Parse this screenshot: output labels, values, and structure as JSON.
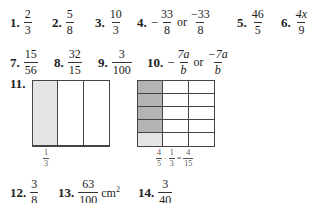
{
  "answers": {
    "a1": {
      "label": "1.",
      "num": "2",
      "den": "3"
    },
    "a2": {
      "label": "2.",
      "num": "5",
      "den": "8"
    },
    "a3": {
      "label": "3.",
      "num": "10",
      "den": "3"
    },
    "a4": {
      "label": "4.",
      "sign": "−",
      "num": "33",
      "den": "8",
      "or": "or",
      "num2": "−33",
      "den2": "8"
    },
    "a5": {
      "label": "5.",
      "num": "46",
      "den": "5"
    },
    "a6": {
      "label": "6.",
      "num": "4x",
      "den": "9"
    },
    "a7": {
      "label": "7.",
      "num": "15",
      "den": "56"
    },
    "a8": {
      "label": "8.",
      "num": "32",
      "den": "15"
    },
    "a9": {
      "label": "9.",
      "num": "3",
      "den": "100"
    },
    "a10": {
      "label": "10.",
      "sign": "−",
      "num": "7a",
      "den": "b",
      "or": "or",
      "num2": "−7a",
      "den2": "b"
    },
    "a11": {
      "label": "11."
    },
    "a12": {
      "label": "12.",
      "num": "3",
      "den": "8"
    },
    "a13": {
      "label": "13.",
      "num": "63",
      "den": "100",
      "unit": "cm",
      "exp": "2"
    },
    "a14": {
      "label": "14.",
      "num": "3",
      "den": "40"
    }
  },
  "diagram": {
    "left": {
      "cols": 3,
      "rows": 1,
      "shaded_color": "#e4e4e4",
      "label": {
        "num": "1",
        "den": "3"
      }
    },
    "right": {
      "cols": 3,
      "rows": 5,
      "dark_color": "#b4b4b4",
      "light_color": "#e4e4e4",
      "label": {
        "a_num": "4",
        "a_den": "5",
        "dot": "·",
        "b_num": "1",
        "b_den": "3",
        "eq": "=",
        "c_num": "4",
        "c_den": "15"
      }
    }
  }
}
